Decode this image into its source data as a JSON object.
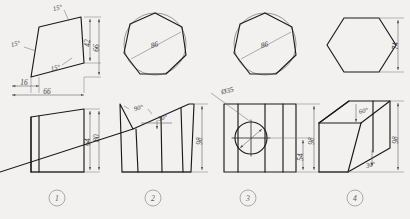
{
  "sheet": {
    "title": "Orthographic projection exercise sheet",
    "background": "#f2f1ef",
    "line_color": "#1a1a1a"
  },
  "figures": [
    {
      "number": "1",
      "top_view": {
        "shape": "irregular-quadrilateral",
        "dimensions": [
          {
            "label": "15°",
            "kind": "angle",
            "position": "top"
          },
          {
            "label": "15°",
            "kind": "angle",
            "position": "left"
          },
          {
            "label": "15°",
            "kind": "angle",
            "position": "center"
          },
          {
            "label": "42",
            "kind": "linear",
            "position": "right-inner"
          },
          {
            "label": "66",
            "kind": "linear",
            "position": "right-outer"
          },
          {
            "label": "16",
            "kind": "linear",
            "position": "bottom-left"
          },
          {
            "label": "66",
            "kind": "linear",
            "position": "bottom"
          }
        ]
      },
      "front_view": {
        "shape": "truncated-wedge",
        "dimensions": [
          {
            "label": "64",
            "kind": "linear",
            "position": "right-inner"
          },
          {
            "label": "80",
            "kind": "linear",
            "position": "right-outer"
          }
        ]
      }
    },
    {
      "number": "2",
      "top_view": {
        "shape": "heptagon-in-circle",
        "dimensions": [
          {
            "label": "86",
            "kind": "linear",
            "position": "across"
          }
        ]
      },
      "front_view": {
        "shape": "vee-notched-prism",
        "dimensions": [
          {
            "label": "90°",
            "kind": "angle",
            "position": "notch"
          },
          {
            "label": "30°",
            "kind": "angle",
            "position": "slope"
          },
          {
            "label": "98",
            "kind": "linear",
            "position": "right"
          }
        ]
      }
    },
    {
      "number": "3",
      "top_view": {
        "shape": "heptagon-in-circle",
        "dimensions": [
          {
            "label": "86",
            "kind": "linear",
            "position": "across"
          }
        ]
      },
      "front_view": {
        "shape": "prism-with-bore",
        "dimensions": [
          {
            "label": "Ø35",
            "kind": "diameter",
            "position": "leader"
          },
          {
            "label": "54",
            "kind": "linear",
            "position": "right-inner"
          },
          {
            "label": "98",
            "kind": "linear",
            "position": "right-outer"
          }
        ]
      }
    },
    {
      "number": "4",
      "top_view": {
        "shape": "hexagon",
        "dimensions": [
          {
            "label": "74",
            "kind": "linear",
            "position": "right"
          }
        ]
      },
      "front_view": {
        "shape": "oblique-sheared-prism",
        "dimensions": [
          {
            "label": "60°",
            "kind": "angle",
            "position": "upper"
          },
          {
            "label": "30°",
            "kind": "angle",
            "position": "lower"
          },
          {
            "label": "98",
            "kind": "linear",
            "position": "right"
          }
        ]
      }
    }
  ],
  "labels": {
    "fig1": "1",
    "fig2": "2",
    "fig3": "3",
    "fig4": "4",
    "f1_top_ang_top": "15°",
    "f1_top_ang_left": "15°",
    "f1_top_ang_mid": "15°",
    "f1_top_42": "42",
    "f1_top_66r": "66",
    "f1_top_16": "16",
    "f1_top_66b": "66",
    "f1_front_64": "64",
    "f1_front_80": "80",
    "f2_top_86": "86",
    "f2_front_90": "90°",
    "f2_front_30": "30°",
    "f2_front_98": "98",
    "f3_top_86": "86",
    "f3_front_d35": "Ø35",
    "f3_front_54": "54",
    "f3_front_98": "98",
    "f4_top_74": "74",
    "f4_front_60": "60°",
    "f4_front_30": "30°",
    "f4_front_98": "98"
  }
}
